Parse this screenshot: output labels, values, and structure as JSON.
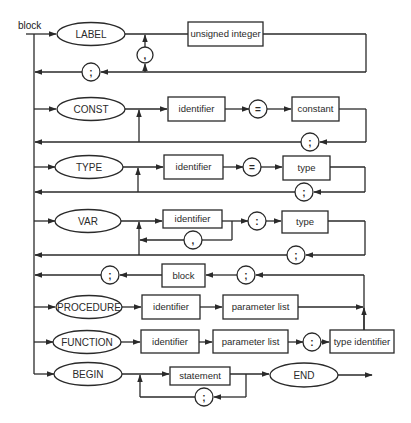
{
  "diagram": {
    "title": "block",
    "rows": {
      "label": {
        "keyword": "LABEL",
        "box": "unsigned integer",
        "sep": ",",
        "term": ";"
      },
      "const": {
        "keyword": "CONST",
        "box1": "identifier",
        "op": "=",
        "box2": "constant",
        "term": ";"
      },
      "type": {
        "keyword": "TYPE",
        "box1": "identifier",
        "op": "=",
        "box2": "type",
        "term": ";"
      },
      "var": {
        "keyword": "VAR",
        "box1": "identifier",
        "sep": ",",
        "op": ":",
        "box2": "type",
        "term": ";"
      },
      "subblock": {
        "pre": ";",
        "box": "block",
        "post": ";"
      },
      "procedure": {
        "keyword": "PROCEDURE",
        "box1": "identifier",
        "box2": "parameter list"
      },
      "function": {
        "keyword": "FUNCTION",
        "box1": "identifier",
        "box2": "parameter list",
        "op": ":",
        "box3": "type identifier"
      },
      "begin": {
        "keyword": "BEGIN",
        "box": "statement",
        "sep": ";",
        "end_keyword": "END"
      }
    }
  }
}
